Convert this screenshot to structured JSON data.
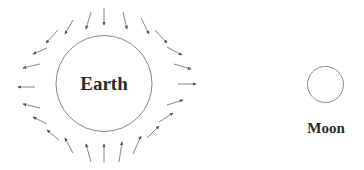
{
  "diagram": {
    "type": "tidal-forces",
    "bodies": [
      {
        "id": "earth",
        "label": "Earth"
      },
      {
        "id": "moon",
        "label": "Moon"
      }
    ],
    "colors": {
      "outline": "#8a8a8a",
      "arrow": "#7a7a7a",
      "text": "#2b2b2b"
    },
    "arrow_count": 24
  }
}
